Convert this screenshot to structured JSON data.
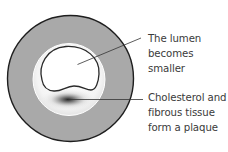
{
  "diagram": {
    "colors": {
      "artery_wall": "#a9a9a9",
      "outline": "#222222",
      "inner_layer": "#f2f2f2",
      "lumen": "#ffffff",
      "plaque_core": "#2b2b2b",
      "text": "#3a3a3a"
    },
    "labels": [
      {
        "id": "lumen",
        "lines": [
          "The lumen",
          "becomes",
          "smaller"
        ]
      },
      {
        "id": "plaque",
        "lines": [
          "Cholesterol and",
          "fibrous tissue",
          "form a plaque"
        ]
      }
    ]
  }
}
